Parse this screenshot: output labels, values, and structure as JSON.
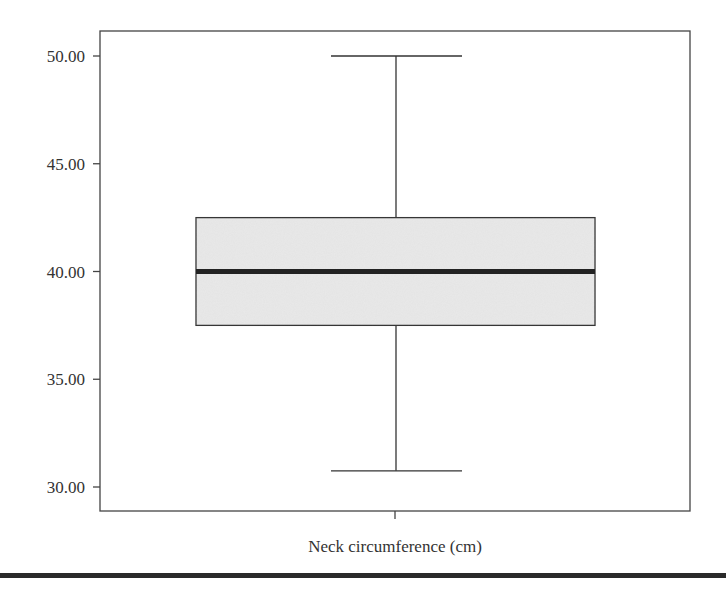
{
  "chart_data": {
    "type": "boxplot",
    "title": "",
    "xlabel": "Neck circumference (cm)",
    "ylabel": "",
    "categories": [
      "Neck circumference (cm)"
    ],
    "ylim": [
      28.9,
      51.1
    ],
    "yticks": [
      30,
      35,
      40,
      45,
      50
    ],
    "ytick_labels": [
      "30.00",
      "35.00",
      "40.00",
      "45.00",
      "50.00"
    ],
    "grid": false,
    "legend": null,
    "boxes": [
      {
        "name": "Neck circumference (cm)",
        "min": 30.75,
        "q1": 37.5,
        "median": 40.0,
        "q3": 42.5,
        "max": 50.0
      }
    ],
    "colors": {
      "box_fill": "#e9e9e9",
      "stroke": "#333333",
      "median": "#222222"
    }
  }
}
